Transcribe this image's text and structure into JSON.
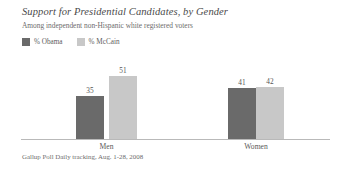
{
  "chart_data": {
    "type": "bar",
    "title": "Support for Presidential Candidates, by Gender",
    "subtitle": "Among independent non-Hispanic white registered voters",
    "xlabel": "",
    "ylabel": "",
    "ylim": [
      0,
      60
    ],
    "grid": false,
    "legend_position": "top-left",
    "source": "Gallup Poll Daily tracking, Aug. 1-28, 2008",
    "categories": [
      "Men",
      "Women"
    ],
    "series": [
      {
        "name": "% Obama",
        "color": "#6a6a6a",
        "values": [
          35,
          41
        ]
      },
      {
        "name": "% McCain",
        "color": "#c8c8c8",
        "values": [
          51,
          42
        ]
      }
    ]
  },
  "colors": {
    "obama": "#6a6a6a",
    "mccain": "#c8c8c8",
    "axis": "#b9b9b9",
    "text": "#5a5a5a",
    "background": "#ffffff"
  }
}
